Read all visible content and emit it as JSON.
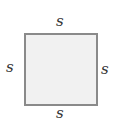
{
  "diagram": {
    "shape": "square",
    "fill_color": "#f1f1f1",
    "border_color": "#8a8a8a",
    "labels": {
      "top": "s",
      "bottom": "s",
      "left": "s",
      "right": "s"
    }
  }
}
